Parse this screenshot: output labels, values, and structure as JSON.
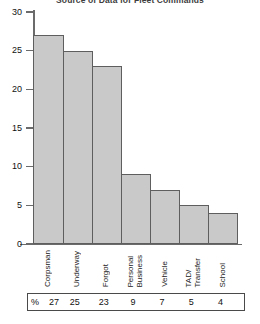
{
  "chart_data": {
    "type": "bar",
    "title": "Source of Data for Fleet Commands",
    "xlabel": "",
    "ylabel": "",
    "ylim": [
      0,
      30
    ],
    "yticks": [
      "0",
      "5",
      "10",
      "15",
      "20",
      "25",
      "30"
    ],
    "grid": false,
    "legend": null,
    "categories": [
      "Corpsman",
      "Underway",
      "Forgot",
      "Personal Business",
      "Vehicle",
      "TAD/ Transfer",
      "School"
    ],
    "category_lines": [
      [
        "Corpsman"
      ],
      [
        "Underway"
      ],
      [
        "Forgot"
      ],
      [
        "Personal",
        "Business"
      ],
      [
        "Vehicle"
      ],
      [
        "TAD/",
        "Transfer"
      ],
      [
        "School"
      ]
    ],
    "values": [
      27,
      25,
      23,
      9,
      7,
      5,
      4
    ],
    "bar_fill_color": "#c9c9c9",
    "bar_border_color": "#5e5e5e",
    "axis_color": "#6b6b6b"
  },
  "table": {
    "percent_symbol": "%",
    "values": [
      "27",
      "25",
      "23",
      "9",
      "7",
      "5",
      "4"
    ]
  }
}
